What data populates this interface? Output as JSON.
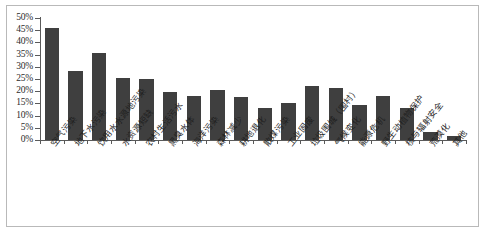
{
  "chart_data": {
    "type": "bar",
    "title": "",
    "subtitle": "",
    "xlabel": "",
    "ylabel": "",
    "ylim": [
      0,
      50
    ],
    "ytick_labels": [
      "50%",
      "45%",
      "40%",
      "35%",
      "30%",
      "25%",
      "20%",
      "15%",
      "10%",
      "5%",
      "0%"
    ],
    "ytick_values": [
      50,
      45,
      40,
      35,
      30,
      25,
      20,
      15,
      10,
      5,
      0
    ],
    "grid": false,
    "legend": null,
    "bar_color": "#3f3f3f",
    "axis_color": "#5a5a5a",
    "background": "#ffffff",
    "categories": [
      "空气污染",
      "地下水污染",
      "饮用水水源地污染",
      "水资源短缺",
      "农村生活污水",
      "黑臭水体",
      "海洋污染",
      "森林减少",
      "耕地退化",
      "散煤污染",
      "工业固废",
      "垃圾围城（围村）",
      "气候变化",
      "能源危机",
      "野生动植物保护",
      "核与辐射安全",
      "荒漠化",
      "其他"
    ],
    "values": [
      46,
      28.5,
      35.5,
      25.5,
      25,
      19.5,
      18,
      20.5,
      17.5,
      13,
      15,
      22,
      21.5,
      14.5,
      18,
      13,
      3.5,
      1.5
    ]
  }
}
